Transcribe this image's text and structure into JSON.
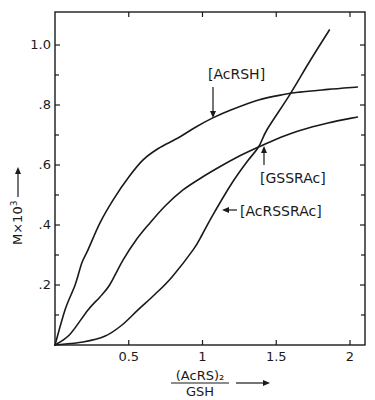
{
  "chart_data": {
    "type": "line",
    "title": "",
    "xlabel": "(AcRS)₂ / GSH",
    "xlabel_numerator": "(AcRS)₂",
    "xlabel_denominator": "GSH",
    "ylabel": "M×10³",
    "xlim": [
      0,
      2.1
    ],
    "ylim": [
      0,
      1.11
    ],
    "grid": false,
    "x_ticks": [
      0.5,
      1,
      1.5,
      2
    ],
    "x_tick_labels": [
      "0.5",
      "1",
      "1.5",
      "2"
    ],
    "x_minor_ticks": [],
    "y_ticks": [
      0.2,
      0.4,
      0.6,
      0.8,
      1.0
    ],
    "y_tick_labels": [
      ".2",
      ".4",
      ".6",
      ".8",
      "1.0"
    ],
    "y_minor_ticks": [
      0.1,
      0.3,
      0.5,
      0.7,
      0.9
    ],
    "series": [
      {
        "name": "[AcRSH]",
        "x": [
          0,
          0.068,
          0.136,
          0.183,
          0.224,
          0.305,
          0.393,
          0.5,
          0.597,
          0.7,
          0.834,
          0.95,
          1.07,
          1.2,
          1.38,
          1.55,
          1.66,
          1.85,
          2.05
        ],
        "y": [
          0,
          0.117,
          0.2,
          0.275,
          0.317,
          0.407,
          0.483,
          0.56,
          0.617,
          0.655,
          0.69,
          0.725,
          0.757,
          0.785,
          0.817,
          0.835,
          0.843,
          0.852,
          0.86
        ]
      },
      {
        "name": "[GSSRAc]",
        "x": [
          0,
          0.1,
          0.224,
          0.305,
          0.37,
          0.461,
          0.55,
          0.644,
          0.75,
          0.868,
          1.0,
          1.12,
          1.25,
          1.38,
          1.52,
          1.66,
          1.85,
          2.05
        ],
        "y": [
          0,
          0.035,
          0.117,
          0.16,
          0.2,
          0.283,
          0.35,
          0.407,
          0.465,
          0.517,
          0.56,
          0.595,
          0.63,
          0.66,
          0.69,
          0.715,
          0.74,
          0.76
        ]
      },
      {
        "name": "[AcRSSRAc]",
        "x": [
          0,
          0.19,
          0.34,
          0.45,
          0.563,
          0.68,
          0.793,
          0.936,
          1.0,
          1.07,
          1.2,
          1.3,
          1.38,
          1.44,
          1.59,
          1.72,
          1.86
        ],
        "y": [
          0,
          0.01,
          0.03,
          0.065,
          0.117,
          0.17,
          0.227,
          0.317,
          0.37,
          0.433,
          0.54,
          0.61,
          0.66,
          0.72,
          0.833,
          0.94,
          1.05
        ]
      }
    ],
    "annotations": [
      {
        "text": "[AcRSH]",
        "arrow": "down",
        "points_to": [
          1.07,
          0.757
        ]
      },
      {
        "text": "[GSSRAc]",
        "arrow": "up",
        "points_to": [
          1.41,
          0.66
        ]
      },
      {
        "text": "[AcRSSRAc]",
        "arrow": "left",
        "points_to": [
          1.13,
          0.45
        ]
      }
    ]
  },
  "layout": {
    "plot_left": 55,
    "plot_right": 365,
    "plot_top": 12,
    "plot_bottom": 345,
    "x_unit_px": 147.5,
    "y_unit_px": 300
  }
}
